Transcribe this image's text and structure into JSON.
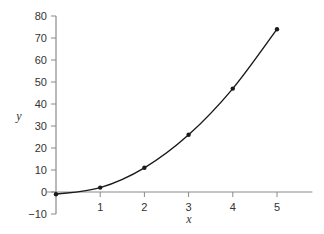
{
  "chart_data": {
    "type": "line",
    "title": "",
    "xlabel": "x",
    "ylabel": "y",
    "x": [
      0,
      1,
      2,
      3,
      4,
      5
    ],
    "series": [
      {
        "name": "y",
        "values": [
          -1,
          2,
          11,
          26,
          47,
          74
        ],
        "markers": true,
        "smooth": true
      }
    ],
    "xlim": [
      0,
      5.8
    ],
    "ylim": [
      -10,
      80
    ],
    "xticks": [
      1,
      2,
      3,
      4,
      5
    ],
    "yticks": [
      -10,
      0,
      10,
      20,
      30,
      40,
      50,
      60,
      70,
      80
    ],
    "grid": false,
    "legend": null,
    "colors": {
      "axis": "#8a8a8a",
      "line": "#1a1a1a",
      "text": "#333333"
    }
  }
}
